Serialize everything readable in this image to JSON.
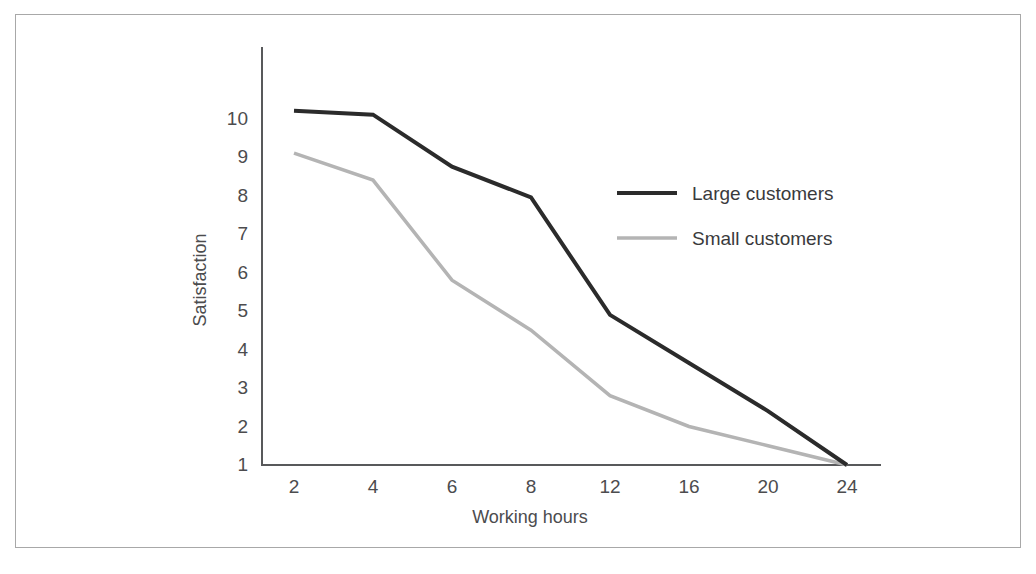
{
  "chart_data": {
    "type": "line",
    "title": "",
    "xlabel": "Working hours",
    "ylabel": "Satisfaction",
    "categories": [
      "2",
      "4",
      "6",
      "8",
      "12",
      "16",
      "20",
      "24"
    ],
    "x_tick_labels": [
      "2",
      "4",
      "6",
      "8",
      "12",
      "16",
      "20",
      "24"
    ],
    "y_tick_labels": [
      "10",
      "9",
      "8",
      "7",
      "6",
      "5",
      "4",
      "3",
      "2",
      "1"
    ],
    "ylim": [
      1,
      10.8
    ],
    "grid": false,
    "legend_position": "inside-upper-right",
    "series": [
      {
        "name": "Large customers",
        "color": "#2b2b2b",
        "values": [
          10.2,
          10.1,
          8.75,
          7.95,
          4.9,
          3.65,
          2.4,
          1.0
        ]
      },
      {
        "name": "Small customers",
        "color": "#b4b4b4",
        "values": [
          9.1,
          8.4,
          5.8,
          4.5,
          2.8,
          2.0,
          1.5,
          1.0
        ]
      }
    ],
    "legend": [
      {
        "label": "Large customers",
        "color": "#2b2b2b"
      },
      {
        "label": "Small customers",
        "color": "#b4b4b4"
      }
    ]
  },
  "colors": {
    "frame_border": "#a8a8a8",
    "axis": "#58595b",
    "background": "#ffffff",
    "large_customers": "#2b2b2b",
    "small_customers": "#b4b4b4",
    "text": "#4c4c4e"
  }
}
